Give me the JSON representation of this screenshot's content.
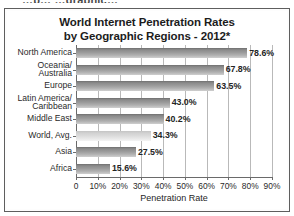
{
  "clipped_caption": "…p…  …graphic…",
  "chart_data": {
    "type": "bar",
    "orientation": "horizontal",
    "title": "World Internet Penetration Rates by Geographic Regions - 2012*",
    "title_line1": "World Internet Penetration Rates",
    "title_line2": "by Geographic Regions - 2012*",
    "categories": [
      "North America",
      "Oceania/ Australia",
      "Europe",
      "Latin America/ Caribbean",
      "Middle East",
      "World, Avg.",
      "Asia",
      "Africa"
    ],
    "category_lines": [
      [
        "North America"
      ],
      [
        "Oceania/",
        "Australia"
      ],
      [
        "Europe"
      ],
      [
        "Latin America/",
        "Caribbean"
      ],
      [
        "Middle East"
      ],
      [
        "World, Avg."
      ],
      [
        "Asia"
      ],
      [
        "Africa"
      ]
    ],
    "values": [
      78.6,
      67.8,
      63.5,
      43.0,
      40.2,
      34.3,
      27.5,
      15.6
    ],
    "value_labels": [
      "78.6%",
      "67.8%",
      "63.5%",
      "43.0%",
      "40.2%",
      "34.3%",
      "27.5%",
      "15.6%"
    ],
    "highlight_index": 5,
    "xlabel": "Penetration Rate",
    "ylabel": "",
    "xlim": [
      0,
      90
    ],
    "xticks": [
      0,
      10,
      20,
      30,
      40,
      50,
      60,
      70,
      80,
      90
    ],
    "xtick_labels": [
      "0",
      "10%",
      "20%",
      "30%",
      "40%",
      "50%",
      "60%",
      "70%",
      "80%",
      "90%"
    ],
    "grid": true,
    "grid_axis": "x",
    "legend": null,
    "colors": {
      "bar_dark_top": "#6f6f6f",
      "bar_dark_bottom": "#cfcfcf",
      "bar_light_top": "#c4c4c4",
      "bar_light_bottom": "#f4f4f4",
      "gridline": "#b9b9b9",
      "axis": "#6a6a6a",
      "text": "#1c1c1c",
      "frame": "#5e5e5e",
      "background": "#ffffff"
    }
  }
}
